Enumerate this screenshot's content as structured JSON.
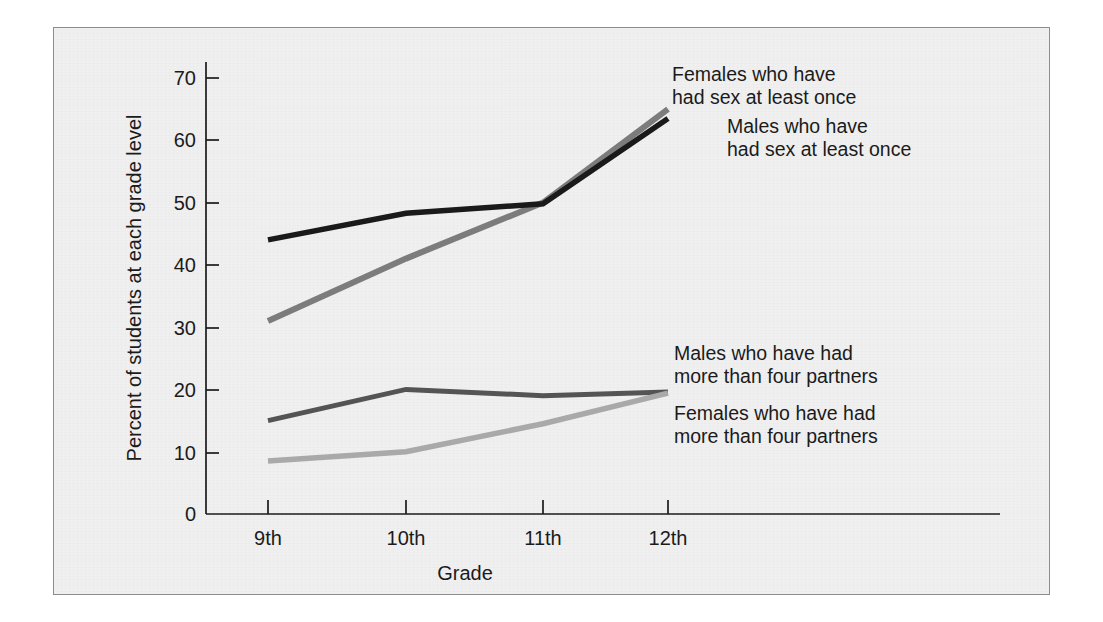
{
  "chart_data": {
    "type": "line",
    "title": "",
    "xlabel": "Grade",
    "ylabel": "Percent of students at each grade level",
    "categories": [
      "9th",
      "10th",
      "11th",
      "12th"
    ],
    "ylim": [
      0,
      74
    ],
    "yticks": [
      0,
      10,
      20,
      30,
      40,
      50,
      60,
      70
    ],
    "ytick_labels": [
      "0",
      "10",
      "20",
      "30",
      "40",
      "50",
      "60",
      "70"
    ],
    "grid": false,
    "legend_position": "inline-right-annotations",
    "series": [
      {
        "name": "Females who have had sex at least once",
        "values": [
          31,
          41,
          50,
          65
        ],
        "color": "#7c7c7c"
      },
      {
        "name": "Males who have had sex at least once",
        "values": [
          44,
          48.3,
          49.8,
          63.5
        ],
        "color": "#1a1a1a"
      },
      {
        "name": "Males who have had more than four partners",
        "values": [
          15,
          20,
          19,
          19.6
        ],
        "color": "#545454"
      },
      {
        "name": "Females who have had more than four partners",
        "values": [
          8.5,
          10,
          14.5,
          19.4
        ],
        "color": "#a9a9a9"
      }
    ]
  },
  "annotations": {
    "females_sex_line1": "Females who have",
    "females_sex_line2": "had sex at least once",
    "males_sex_line1": "Males who have",
    "males_sex_line2": "had sex at least once",
    "males_partners_line1": "Males who have had",
    "males_partners_line2": "more than four partners",
    "females_partners_line1": "Females who have had",
    "females_partners_line2": "more than four partners"
  },
  "axis": {
    "x_title": "Grade",
    "y_title": "Percent of students at each grade level",
    "x_tick_0": "9th",
    "x_tick_1": "10th",
    "x_tick_2": "11th",
    "x_tick_3": "12th",
    "y_tick_0": "0",
    "y_tick_10": "10",
    "y_tick_20": "20",
    "y_tick_30": "30",
    "y_tick_40": "40",
    "y_tick_50": "50",
    "y_tick_60": "60",
    "y_tick_70": "70"
  },
  "colors": {
    "background": "#f0f0f0",
    "page": "#ffffff",
    "axis": "#1b1b1b",
    "females_sex": "#7c7c7c",
    "males_sex": "#1a1a1a",
    "males_partners": "#545454",
    "females_partners": "#a9a9a9"
  }
}
